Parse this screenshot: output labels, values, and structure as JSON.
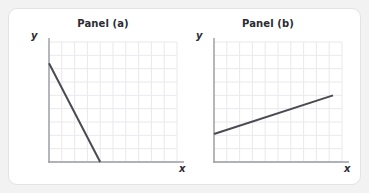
{
  "figure": {
    "background_color": "#f2f2f3",
    "card_color": "#ffffff",
    "card_border_color": "#e3e3e6",
    "line_color": "#4a4a52",
    "grid_color": "#e9e9ee",
    "axis_color": "#9b9ba3",
    "title_color": "#2b2b33"
  },
  "panels": [
    {
      "id": "a",
      "title": "Panel (a)",
      "x_axis_label": "x",
      "y_axis_label": "y"
    },
    {
      "id": "b",
      "title": "Panel (b)",
      "x_axis_label": "x",
      "y_axis_label": "y"
    }
  ],
  "chart_data": [
    {
      "type": "line",
      "title": "Panel (a)",
      "xlabel": "x",
      "ylabel": "y",
      "grid": true,
      "xlim": [
        0,
        10
      ],
      "ylim": [
        0,
        9
      ],
      "xticks": [
        0,
        1,
        2,
        3,
        4,
        5,
        6,
        7,
        8,
        9,
        10
      ],
      "yticks": [
        0,
        1,
        2,
        3,
        4,
        5,
        6,
        7,
        8,
        9
      ],
      "xticklabels": [],
      "yticklabels": [],
      "legend": null,
      "series": [
        {
          "name": "downward sloping line",
          "x": [
            0,
            4
          ],
          "y": [
            7.4,
            0
          ],
          "slope": -1.85,
          "intercept": 7.4,
          "color": "#4a4a52",
          "linewidth": 2
        }
      ]
    },
    {
      "type": "line",
      "title": "Panel (b)",
      "xlabel": "x",
      "ylabel": "y",
      "grid": true,
      "xlim": [
        0,
        10
      ],
      "ylim": [
        0,
        9
      ],
      "xticks": [
        0,
        1,
        2,
        3,
        4,
        5,
        6,
        7,
        8,
        9,
        10
      ],
      "yticks": [
        0,
        1,
        2,
        3,
        4,
        5,
        6,
        7,
        8,
        9
      ],
      "xticklabels": [],
      "yticklabels": [],
      "legend": null,
      "series": [
        {
          "name": "upward sloping line",
          "x": [
            0,
            9.3
          ],
          "y": [
            2.1,
            5.0
          ],
          "slope": 0.312,
          "intercept": 2.1,
          "color": "#4a4a52",
          "linewidth": 2
        }
      ]
    }
  ]
}
